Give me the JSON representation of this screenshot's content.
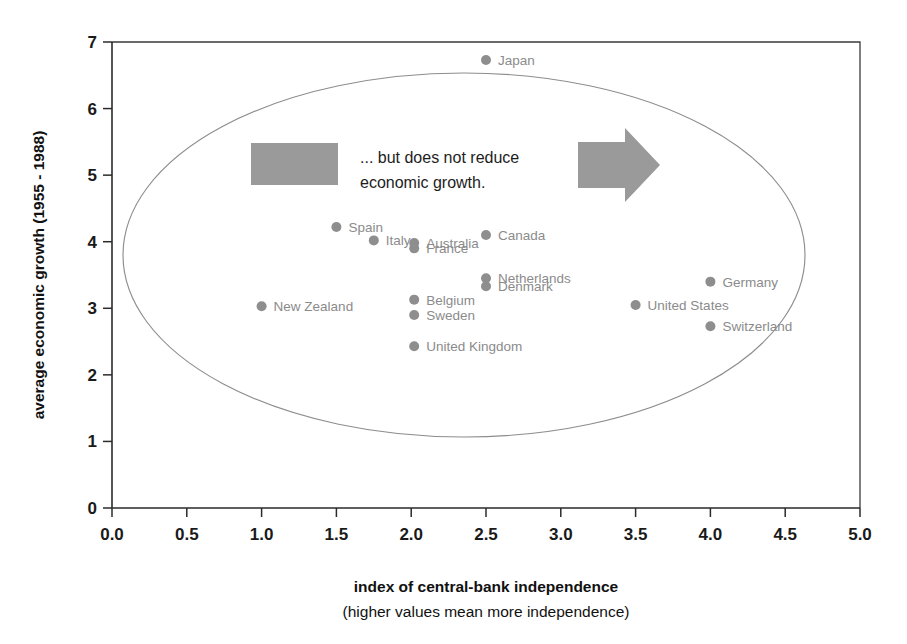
{
  "chart_data": {
    "type": "scatter",
    "title": "",
    "xlabel": "index of central-bank independence",
    "xlabel_sub": "(higher values mean more independence)",
    "ylabel": "average economic growth (1955 - 1988)",
    "xlim": [
      0.0,
      5.0
    ],
    "ylim": [
      0,
      7
    ],
    "grid": false,
    "legend": "none",
    "xticks": [
      "0.0",
      "0.5",
      "1.0",
      "1.5",
      "2.0",
      "2.5",
      "3.0",
      "3.5",
      "4.0",
      "4.5",
      "5.0"
    ],
    "xtick_values": [
      0.0,
      0.5,
      1.0,
      1.5,
      2.0,
      2.5,
      3.0,
      3.5,
      4.0,
      4.5,
      5.0
    ],
    "yticks": [
      "0",
      "1",
      "2",
      "3",
      "4",
      "5",
      "6",
      "7"
    ],
    "ytick_values": [
      0,
      1,
      2,
      3,
      4,
      5,
      6,
      7
    ],
    "points": [
      {
        "label": "Japan",
        "x": 2.5,
        "y": 6.73
      },
      {
        "label": "Spain",
        "x": 1.5,
        "y": 4.22
      },
      {
        "label": "Canada",
        "x": 2.5,
        "y": 4.1
      },
      {
        "label": "Italy",
        "x": 1.75,
        "y": 4.02
      },
      {
        "label": "Australia",
        "x": 2.02,
        "y": 3.98
      },
      {
        "label": "France",
        "x": 2.02,
        "y": 3.9
      },
      {
        "label": "Netherlands",
        "x": 2.5,
        "y": 3.45
      },
      {
        "label": "Germany",
        "x": 4.0,
        "y": 3.4
      },
      {
        "label": "Denmark",
        "x": 2.5,
        "y": 3.33
      },
      {
        "label": "Belgium",
        "x": 2.02,
        "y": 3.13
      },
      {
        "label": "United States",
        "x": 3.5,
        "y": 3.05
      },
      {
        "label": "New Zealand",
        "x": 1.0,
        "y": 3.03
      },
      {
        "label": "Sweden",
        "x": 2.02,
        "y": 2.9
      },
      {
        "label": "Switzerland",
        "x": 4.0,
        "y": 2.73
      },
      {
        "label": "United Kingdom",
        "x": 2.02,
        "y": 2.43
      }
    ],
    "annotations": [
      {
        "name": "callout",
        "line1": "... but does not reduce",
        "line2": "economic growth."
      }
    ],
    "shapes": [
      {
        "name": "grouping-ellipse",
        "type": "ellipse"
      },
      {
        "name": "callout-swatch",
        "type": "rect"
      },
      {
        "name": "callout-arrow",
        "type": "arrow-right"
      }
    ]
  },
  "colors": {
    "dot": "#8e8e8e",
    "label": "#8b8b8b",
    "axis": "#2b2b2b",
    "ellipse": "#8d8d8d",
    "callout_gray": "#9a9a9a",
    "background": "#ffffff"
  }
}
